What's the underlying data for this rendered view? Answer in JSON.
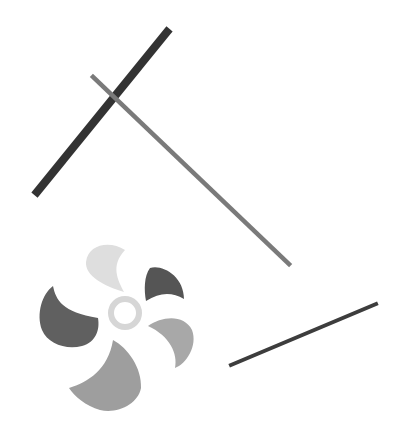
{
  "canvas": {
    "width": 403,
    "height": 441,
    "background": "#ffffff"
  },
  "lines": [
    {
      "name": "thick-dark-line",
      "x1": 167,
      "y1": 32,
      "x2": 37,
      "y2": 192,
      "stroke": "#333333",
      "width": 8
    },
    {
      "name": "gray-diagonal-line",
      "x1": 93,
      "y1": 77,
      "x2": 289,
      "y2": 264,
      "stroke": "#7a7a7a",
      "width": 4.5
    },
    {
      "name": "thin-dark-line",
      "x1": 231,
      "y1": 365,
      "x2": 376,
      "y2": 304,
      "stroke": "#3d3d3d",
      "width": 4
    }
  ],
  "fan": {
    "hub": {
      "cx": 125,
      "cy": 313,
      "r": 14,
      "stroke": "#d6d6d6",
      "width": 6
    },
    "blades": [
      {
        "name": "blade-top",
        "fill": "#dedede",
        "d": "M 125 250 C 110 240, 88 244, 86 262 C 85 276, 104 286, 124 292 C 118 280, 110 266, 125 250 Z"
      },
      {
        "name": "blade-top-right",
        "fill": "#555555",
        "d": "M 150 268 C 162 264, 184 276, 184 299 C 172 292, 160 292, 146 301 C 144 290, 144 276, 150 268 Z"
      },
      {
        "name": "blade-right",
        "fill": "#a8a8a8",
        "d": "M 148 326 C 162 316, 184 314, 192 330 C 198 346, 186 364, 175 368 C 178 354, 170 336, 148 326 Z"
      },
      {
        "name": "blade-bottom",
        "fill": "#9e9e9e",
        "d": "M 113 340 C 128 348, 142 368, 141 388 C 138 404, 118 414, 100 410 C 86 406, 74 396, 69 388 C 88 382, 108 370, 113 340 Z"
      },
      {
        "name": "blade-left",
        "fill": "#606060",
        "d": "M 53 286 C 56 300, 62 312, 98 318 C 100 330, 96 342, 82 346 C 66 350, 48 344, 42 330 C 36 314, 42 294, 53 286 Z"
      }
    ]
  }
}
